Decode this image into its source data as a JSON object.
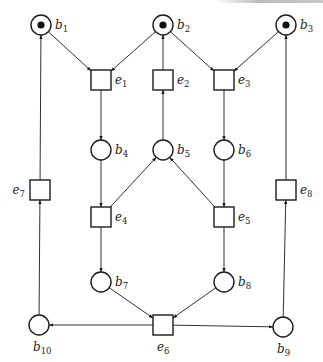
{
  "diagram": {
    "type": "petri-net",
    "colors": {
      "stroke": "#1a1a1a",
      "token": "#111111",
      "background": "#ffffff"
    },
    "places": [
      {
        "id": "b1",
        "base": "b",
        "sub": "1",
        "x": 41,
        "y": 25,
        "tokens": 1,
        "label_pos": "right"
      },
      {
        "id": "b2",
        "base": "b",
        "sub": "2",
        "x": 163,
        "y": 25,
        "tokens": 1,
        "label_pos": "right"
      },
      {
        "id": "b3",
        "base": "b",
        "sub": "3",
        "x": 286,
        "y": 25,
        "tokens": 1,
        "label_pos": "right"
      },
      {
        "id": "b4",
        "base": "b",
        "sub": "4",
        "x": 101,
        "y": 150,
        "tokens": 0,
        "label_pos": "right"
      },
      {
        "id": "b5",
        "base": "b",
        "sub": "5",
        "x": 163,
        "y": 150,
        "tokens": 0,
        "label_pos": "right"
      },
      {
        "id": "b6",
        "base": "b",
        "sub": "6",
        "x": 224,
        "y": 150,
        "tokens": 0,
        "label_pos": "right"
      },
      {
        "id": "b7",
        "base": "b",
        "sub": "7",
        "x": 101,
        "y": 282,
        "tokens": 0,
        "label_pos": "right"
      },
      {
        "id": "b8",
        "base": "b",
        "sub": "8",
        "x": 224,
        "y": 282,
        "tokens": 0,
        "label_pos": "right"
      },
      {
        "id": "b9",
        "base": "b",
        "sub": "9",
        "x": 283,
        "y": 327,
        "tokens": 0,
        "label_pos": "below"
      },
      {
        "id": "b10",
        "base": "b",
        "sub": "10",
        "x": 39,
        "y": 325,
        "tokens": 0,
        "label_pos": "below"
      }
    ],
    "transitions": [
      {
        "id": "e1",
        "base": "e",
        "sub": "1",
        "x": 101,
        "y": 80,
        "label_pos": "right"
      },
      {
        "id": "e2",
        "base": "e",
        "sub": "2",
        "x": 163,
        "y": 80,
        "label_pos": "right"
      },
      {
        "id": "e3",
        "base": "e",
        "sub": "3",
        "x": 224,
        "y": 80,
        "label_pos": "right"
      },
      {
        "id": "e4",
        "base": "e",
        "sub": "4",
        "x": 101,
        "y": 217,
        "label_pos": "right"
      },
      {
        "id": "e5",
        "base": "e",
        "sub": "5",
        "x": 224,
        "y": 217,
        "label_pos": "right"
      },
      {
        "id": "e6",
        "base": "e",
        "sub": "6",
        "x": 163,
        "y": 325,
        "label_pos": "below"
      },
      {
        "id": "e7",
        "base": "e",
        "sub": "7",
        "x": 40,
        "y": 190,
        "label_pos": "left"
      },
      {
        "id": "e8",
        "base": "e",
        "sub": "8",
        "x": 286,
        "y": 190,
        "label_pos": "right"
      }
    ],
    "arcs": [
      {
        "from": "b1",
        "to": "e1"
      },
      {
        "from": "b2",
        "to": "e1"
      },
      {
        "from": "b2",
        "to": "e3"
      },
      {
        "from": "b3",
        "to": "e3"
      },
      {
        "from": "e2",
        "to": "b2"
      },
      {
        "from": "e1",
        "to": "b4"
      },
      {
        "from": "b5",
        "to": "e2"
      },
      {
        "from": "e3",
        "to": "b6"
      },
      {
        "from": "b4",
        "to": "e4"
      },
      {
        "from": "e4",
        "to": "b5"
      },
      {
        "from": "e5",
        "to": "b5"
      },
      {
        "from": "b6",
        "to": "e5"
      },
      {
        "from": "e4",
        "to": "b7"
      },
      {
        "from": "e5",
        "to": "b8"
      },
      {
        "from": "b7",
        "to": "e6"
      },
      {
        "from": "b8",
        "to": "e6"
      },
      {
        "from": "e6",
        "to": "b10"
      },
      {
        "from": "e6",
        "to": "b9"
      },
      {
        "from": "b10",
        "to": "e7"
      },
      {
        "from": "e7",
        "to": "b1"
      },
      {
        "from": "b9",
        "to": "e8"
      },
      {
        "from": "e8",
        "to": "b3"
      }
    ]
  }
}
